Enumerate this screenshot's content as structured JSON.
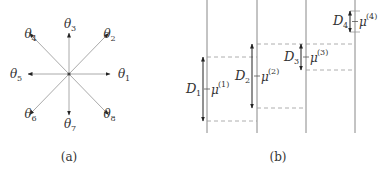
{
  "panel_a": {
    "caption": "(a)",
    "center_symbol": "origin-dot",
    "directions": [
      {
        "symbol": "θ",
        "index": "1",
        "direction": "east"
      },
      {
        "symbol": "θ",
        "index": "2",
        "direction": "north-east"
      },
      {
        "symbol": "θ",
        "index": "3",
        "direction": "north"
      },
      {
        "symbol": "θ",
        "index": "4",
        "direction": "north-west"
      },
      {
        "symbol": "θ",
        "index": "5",
        "direction": "west"
      },
      {
        "symbol": "θ",
        "index": "6",
        "direction": "south-west"
      },
      {
        "symbol": "θ",
        "index": "7",
        "direction": "south"
      },
      {
        "symbol": "θ",
        "index": "8",
        "direction": "south-east"
      }
    ]
  },
  "panel_b": {
    "caption": "(b)",
    "intervals": [
      {
        "label": "D",
        "label_index": "1",
        "mean": "μ",
        "mean_index": "(1)"
      },
      {
        "label": "D",
        "label_index": "2",
        "mean": "μ",
        "mean_index": "(2)"
      },
      {
        "label": "D",
        "label_index": "3",
        "mean": "μ",
        "mean_index": "(3)"
      },
      {
        "label": "D",
        "label_index": "4",
        "mean": "μ",
        "mean_index": "(4)"
      }
    ]
  },
  "colors": {
    "line": "#aaaaaa",
    "axis": "#888888",
    "arrow": "#222222",
    "text": "#333333",
    "dash": "#999999"
  }
}
